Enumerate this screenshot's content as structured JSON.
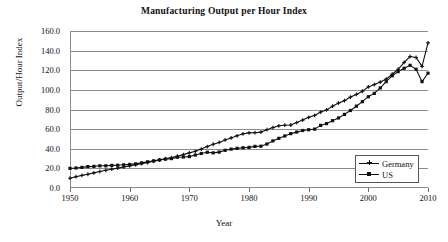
{
  "chart_data": {
    "type": "line",
    "title": "Manufacturing Output per Hour Index",
    "xlabel": "Year",
    "ylabel": "Output/Hour Index",
    "grid": true,
    "legend_position": "bottom-right",
    "xlim": [
      1950,
      2010
    ],
    "ylim": [
      0.0,
      160.0
    ],
    "xticks": [
      1950,
      1960,
      1970,
      1980,
      1990,
      2000,
      2010
    ],
    "xtick_labels": [
      "1950",
      "1960",
      "1970",
      "1980",
      "1990",
      "2000",
      "2010"
    ],
    "yticks": [
      0.0,
      20.0,
      40.0,
      60.0,
      80.0,
      100.0,
      120.0,
      140.0,
      160.0
    ],
    "ytick_labels": [
      "0.0",
      "20.0",
      "40.0",
      "60.0",
      "80.0",
      "100.0",
      "120.0",
      "140.0",
      "160.0"
    ],
    "x": [
      1950,
      1951,
      1952,
      1953,
      1954,
      1955,
      1956,
      1957,
      1958,
      1959,
      1960,
      1961,
      1962,
      1963,
      1964,
      1965,
      1966,
      1967,
      1968,
      1969,
      1970,
      1971,
      1972,
      1973,
      1974,
      1975,
      1976,
      1977,
      1978,
      1979,
      1980,
      1981,
      1982,
      1983,
      1984,
      1985,
      1986,
      1987,
      1988,
      1989,
      1990,
      1991,
      1992,
      1993,
      1994,
      1995,
      1996,
      1997,
      1998,
      1999,
      2000,
      2001,
      2002,
      2003,
      2004,
      2005,
      2006,
      2007,
      2008,
      2009,
      2010
    ],
    "series": [
      {
        "name": "Germany",
        "marker": "plus",
        "color": "#111111",
        "values": [
          10.0,
          11.5,
          12.8,
          14.0,
          15.4,
          16.8,
          18.0,
          19.2,
          20.3,
          21.4,
          22.5,
          23.6,
          24.8,
          26.0,
          27.3,
          28.6,
          29.8,
          31.0,
          32.4,
          34.0,
          35.8,
          37.4,
          39.6,
          42.2,
          44.6,
          46.4,
          49.0,
          51.0,
          53.2,
          55.2,
          56.2,
          56.4,
          57.0,
          59.4,
          61.6,
          63.4,
          64.0,
          64.2,
          66.6,
          69.2,
          72.0,
          74.0,
          77.4,
          79.6,
          83.4,
          86.6,
          89.0,
          92.6,
          95.4,
          98.6,
          103.0,
          105.4,
          108.0,
          111.0,
          116.0,
          121.0,
          128.0,
          134.0,
          133.0,
          124.0,
          148.0
        ]
      },
      {
        "name": "US",
        "marker": "square",
        "color": "#111111",
        "values": [
          20.0,
          20.4,
          21.0,
          21.8,
          22.0,
          22.6,
          22.6,
          23.0,
          23.2,
          23.6,
          24.0,
          24.6,
          25.6,
          26.6,
          27.6,
          28.6,
          29.4,
          30.0,
          31.4,
          31.6,
          32.0,
          33.6,
          35.2,
          36.4,
          35.8,
          36.6,
          38.4,
          39.6,
          40.4,
          41.0,
          41.4,
          42.4,
          42.6,
          44.8,
          48.0,
          50.6,
          53.0,
          55.4,
          57.0,
          58.6,
          59.4,
          60.0,
          63.8,
          65.6,
          68.6,
          71.4,
          75.0,
          79.0,
          83.4,
          88.0,
          93.0,
          96.4,
          102.0,
          108.4,
          114.4,
          118.6,
          122.0,
          125.0,
          121.0,
          108.4,
          117.0
        ]
      }
    ]
  },
  "legend": {
    "items": [
      {
        "label": "Germany"
      },
      {
        "label": "US"
      }
    ]
  }
}
